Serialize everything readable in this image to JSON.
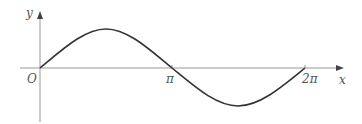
{
  "diagram": {
    "type": "function-graph",
    "function": "y = sin x",
    "domain": "0 to 2π",
    "axes": {
      "x_label": "x",
      "y_label": "y",
      "origin_label": "O"
    },
    "ticks": [
      {
        "label": "π",
        "value": 3.14159
      },
      {
        "label": "2π",
        "value": 6.28318
      }
    ],
    "colors": {
      "axis": "#888888",
      "curve": "#333333",
      "text": "#555555"
    }
  }
}
